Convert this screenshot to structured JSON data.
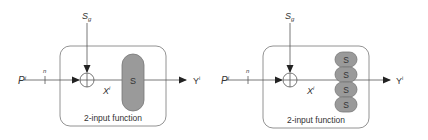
{
  "diagrams": [
    {
      "id": "left",
      "input_label": "P",
      "input_superscript": "i",
      "bus_width_label": "n",
      "control_label": "S",
      "control_subscript": "g",
      "intermediate_label": "X",
      "intermediate_superscript": "i",
      "output_label": "Y",
      "output_superscript": "i",
      "block_caption": "2-input function",
      "s_blocks": [
        "S"
      ]
    },
    {
      "id": "right",
      "input_label": "P",
      "input_superscript": "i",
      "bus_width_label": "n",
      "control_label": "S",
      "control_subscript": "g",
      "intermediate_label": "X",
      "intermediate_superscript": "i",
      "output_label": "Y",
      "output_superscript": "i",
      "block_caption": "2-input function",
      "s_blocks": [
        "S",
        "S",
        "S",
        "S"
      ]
    }
  ],
  "colors": {
    "line": "#555555",
    "box_border": "#777777",
    "s_fill": "#9a9a9a",
    "s_stroke": "#777777",
    "text": "#333333"
  }
}
